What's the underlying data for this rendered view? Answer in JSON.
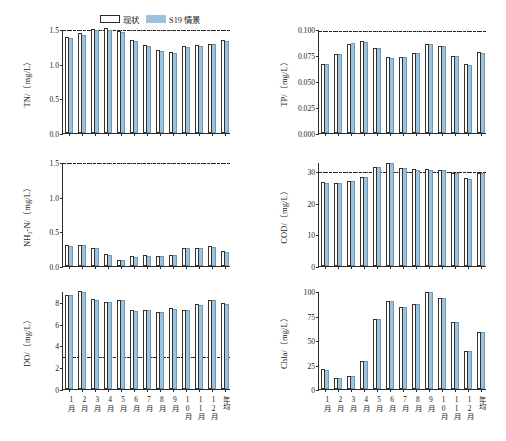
{
  "legend": {
    "items": [
      {
        "label": "现状",
        "key": "current",
        "swatch": "white-bar"
      },
      {
        "label": "S19 情景",
        "key": "s19",
        "swatch": "blue-bar"
      }
    ]
  },
  "colors": {
    "current_fill": "#ffffff",
    "current_edge": "#3a3028",
    "s19_fill": "#9cc3de",
    "s19_edge": "#6f98b5",
    "axis": "#2b2b2b",
    "refline": "#222222"
  },
  "categories": [
    "1月",
    "2月",
    "3月",
    "4月",
    "5月",
    "6月",
    "7月",
    "8月",
    "9月",
    "10月",
    "11月",
    "12月",
    "年均"
  ],
  "chart_data": [
    {
      "id": "tn",
      "type": "bar",
      "title": "",
      "ylabel": "TN/（mg/L）",
      "xlabel": "",
      "ylim": [
        0.0,
        1.5
      ],
      "yticks": [
        0.0,
        0.5,
        1.0,
        1.5
      ],
      "ytick_labels": [
        "0.0",
        "0.5",
        "1.0",
        "1.5"
      ],
      "grid": false,
      "legend_position": "top-center",
      "reference_line": {
        "value": 1.5,
        "style": "dash-dot",
        "label": ""
      },
      "categories": [
        "1月",
        "2月",
        "3月",
        "4月",
        "5月",
        "6月",
        "7月",
        "8月",
        "9月",
        "10月",
        "11月",
        "12月",
        "年均"
      ],
      "series": [
        {
          "name": "现状",
          "values": [
            1.38,
            1.44,
            1.5,
            1.51,
            1.47,
            1.34,
            1.27,
            1.2,
            1.17,
            1.25,
            1.27,
            1.29,
            1.34
          ]
        },
        {
          "name": "S19 情景",
          "values": [
            1.37,
            1.42,
            1.49,
            1.49,
            1.46,
            1.33,
            1.26,
            1.19,
            1.16,
            1.24,
            1.26,
            1.28,
            1.33
          ]
        }
      ]
    },
    {
      "id": "tp",
      "type": "bar",
      "title": "",
      "ylabel": "TP/（mg/L）",
      "xlabel": "",
      "ylim": [
        0.0,
        0.1
      ],
      "yticks": [
        0.0,
        0.025,
        0.05,
        0.075,
        0.1
      ],
      "ytick_labels": [
        "0.000",
        "0.025",
        "0.050",
        "0.075",
        "0.100"
      ],
      "grid": false,
      "legend_position": "none",
      "reference_line": {
        "value": 0.099,
        "style": "dash-dot",
        "label": ""
      },
      "categories": [
        "1月",
        "2月",
        "3月",
        "4月",
        "5月",
        "6月",
        "7月",
        "8月",
        "9月",
        "10月",
        "11月",
        "12月",
        "年均"
      ],
      "series": [
        {
          "name": "现状",
          "values": [
            0.066,
            0.076,
            0.086,
            0.088,
            0.082,
            0.073,
            0.0735,
            0.077,
            0.086,
            0.084,
            0.0745,
            0.066,
            0.0775
          ]
        },
        {
          "name": "S19 情景",
          "values": [
            0.066,
            0.0755,
            0.0865,
            0.0875,
            0.0815,
            0.0725,
            0.073,
            0.0765,
            0.0855,
            0.0835,
            0.074,
            0.0655,
            0.077
          ]
        }
      ]
    },
    {
      "id": "nh3n",
      "type": "bar",
      "title": "",
      "ylabel": "NH₃-N/（mg/L）",
      "xlabel": "",
      "ylim": [
        0.0,
        1.5
      ],
      "yticks": [
        0.0,
        0.5,
        1.0,
        1.5
      ],
      "ytick_labels": [
        "0.0",
        "0.5",
        "1.0",
        "1.5"
      ],
      "grid": false,
      "legend_position": "none",
      "reference_line": {
        "value": 1.5,
        "style": "dash-dot",
        "label": ""
      },
      "categories": [
        "1月",
        "2月",
        "3月",
        "4月",
        "5月",
        "6月",
        "7月",
        "8月",
        "9月",
        "10月",
        "11月",
        "12月",
        "年均"
      ],
      "series": [
        {
          "name": "现状",
          "values": [
            0.31,
            0.31,
            0.26,
            0.17,
            0.09,
            0.14,
            0.155,
            0.15,
            0.165,
            0.265,
            0.26,
            0.285,
            0.21
          ]
        },
        {
          "name": "S19 情景",
          "values": [
            0.295,
            0.305,
            0.255,
            0.165,
            0.085,
            0.135,
            0.15,
            0.145,
            0.16,
            0.26,
            0.255,
            0.28,
            0.205
          ]
        }
      ]
    },
    {
      "id": "cod",
      "type": "bar",
      "title": "",
      "ylabel": "COD/（mg/L）",
      "xlabel": "",
      "ylim": [
        0,
        33
      ],
      "yticks": [
        0,
        10,
        20,
        30
      ],
      "ytick_labels": [
        "0",
        "10",
        "20",
        "30"
      ],
      "grid": false,
      "legend_position": "none",
      "reference_line": {
        "value": 30,
        "style": "dash-dot",
        "label": ""
      },
      "categories": [
        "1月",
        "2月",
        "3月",
        "4月",
        "5月",
        "6月",
        "7月",
        "8月",
        "9月",
        "10月",
        "11月",
        "12月",
        "年均"
      ],
      "series": [
        {
          "name": "现状",
          "values": [
            26.6,
            26.4,
            27.0,
            28.4,
            31.5,
            32.8,
            31.2,
            30.7,
            30.7,
            30.6,
            29.6,
            27.8,
            29.6
          ]
        },
        {
          "name": "S19 情景",
          "values": [
            26.5,
            26.3,
            26.9,
            28.3,
            31.3,
            32.6,
            31.0,
            30.6,
            30.6,
            30.5,
            29.5,
            27.7,
            29.5
          ]
        }
      ]
    },
    {
      "id": "do",
      "type": "bar",
      "title": "",
      "ylabel": "DO/（mg/L）",
      "xlabel": "",
      "ylim": [
        0,
        9
      ],
      "yticks": [
        0,
        2,
        4,
        6,
        8
      ],
      "ytick_labels": [
        "0",
        "2",
        "4",
        "6",
        "8"
      ],
      "grid": false,
      "legend_position": "none",
      "reference_line": {
        "value": 3,
        "style": "dash-dot",
        "label": ""
      },
      "categories": [
        "1月",
        "2月",
        "3月",
        "4月",
        "5月",
        "6月",
        "7月",
        "8月",
        "9月",
        "10月",
        "11月",
        "12月",
        "年均"
      ],
      "series": [
        {
          "name": "现状",
          "values": [
            8.65,
            9.0,
            8.25,
            8.0,
            8.2,
            7.3,
            7.3,
            7.1,
            7.4,
            7.3,
            7.8,
            8.2,
            7.9
          ]
        },
        {
          "name": "S19 情景",
          "values": [
            8.6,
            8.95,
            8.2,
            7.95,
            8.15,
            7.2,
            7.25,
            7.05,
            7.35,
            7.25,
            7.75,
            8.15,
            7.85
          ]
        }
      ]
    },
    {
      "id": "chla",
      "type": "bar",
      "title": "",
      "ylabel": "Chla/（mg/L）",
      "xlabel": "",
      "ylim": [
        0,
        100
      ],
      "yticks": [
        0,
        25,
        50,
        75,
        100
      ],
      "ytick_labels": [
        "0",
        "25",
        "50",
        "75",
        "100"
      ],
      "grid": false,
      "legend_position": "none",
      "reference_line": null,
      "categories": [
        "1月",
        "2月",
        "3月",
        "4月",
        "5月",
        "6月",
        "7月",
        "8月",
        "9月",
        "10月",
        "11月",
        "12月",
        "年均"
      ],
      "series": [
        {
          "name": "现状",
          "values": [
            20,
            11,
            13,
            29,
            71,
            90,
            84,
            87,
            99,
            93,
            68,
            39,
            58
          ]
        },
        {
          "name": "S19 情景",
          "values": [
            19,
            11,
            13,
            29,
            71,
            90,
            84,
            87,
            99,
            93,
            68,
            39,
            58
          ]
        }
      ]
    }
  ]
}
